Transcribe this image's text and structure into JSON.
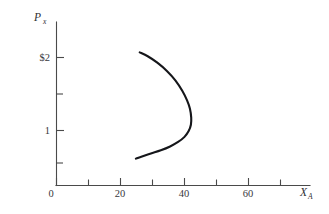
{
  "figure": {
    "background_color": "#ffffff",
    "curve_color": "#15161a",
    "axis_color": "#4a4a4a",
    "text_color": "#38383c"
  },
  "axes": {
    "y_title_main": "P",
    "y_title_sub": "x",
    "x_title_main": "X",
    "x_title_sub": "A",
    "origin_label": "0"
  },
  "chart_data": {
    "type": "line",
    "title": "",
    "subtitle": "",
    "xlabel": "X_A",
    "ylabel": "P_x",
    "xlim": [
      0,
      79
    ],
    "ylim": [
      0,
      2.55
    ],
    "grid": false,
    "legend": null,
    "x_tick_labels": [
      "0",
      "20",
      "40",
      "60"
    ],
    "x_tick_values": [
      0,
      20,
      40,
      60
    ],
    "x_minor_tick_values": [
      10,
      30,
      50,
      70
    ],
    "y_tick_labels": [
      "1",
      "$2"
    ],
    "y_tick_values": [
      1,
      2
    ],
    "y_minor_tick_values": [
      0.5,
      1.5
    ],
    "series": [
      {
        "name": "demand curve",
        "comment": "backward-bending demand curve, opens to the left",
        "x": [
          26,
          28.5,
          31.5,
          34.5,
          37.2,
          39.3,
          40.8,
          41.7,
          42.1,
          42.0,
          41.3,
          40.0,
          38.0,
          35.5,
          32.6,
          29.5,
          26.5,
          24.8
        ],
        "y": [
          2.08,
          2.02,
          1.92,
          1.79,
          1.64,
          1.48,
          1.33,
          1.2,
          1.06,
          0.95,
          0.85,
          0.76,
          0.68,
          0.61,
          0.55,
          0.5,
          0.45,
          0.42
        ]
      }
    ]
  }
}
